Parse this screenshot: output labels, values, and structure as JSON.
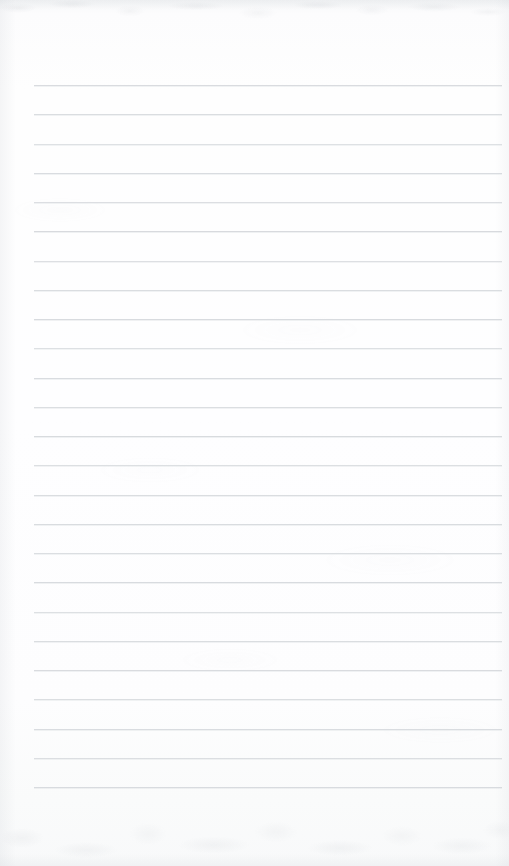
{
  "page": {
    "kind": "blank-ruled-notepad-page",
    "width": 509,
    "height": 866,
    "background_color": "#fdfdfe",
    "has_text": false,
    "text_content": "",
    "header_text": "",
    "footer_text": "",
    "margin_rule_visible": false,
    "page_number": ""
  },
  "ruling": {
    "line_color": "#d6d9dd",
    "line_thickness_px": 1,
    "line_count": 25,
    "left_x": 34,
    "right_x": 502,
    "first_line_y": 85,
    "last_line_y": 787,
    "spacing_px": 29.25,
    "lines_y": [
      85,
      114.3,
      143.5,
      172.8,
      202,
      231.3,
      260.5,
      289.8,
      319,
      348.3,
      377.5,
      406.8,
      436,
      465.3,
      494.5,
      523.8,
      553,
      582.3,
      611.5,
      640.8,
      670,
      699.3,
      728.5,
      757.8,
      787
    ],
    "line_opacity": [
      0.92,
      0.88,
      0.78,
      0.9,
      0.84,
      0.95,
      0.82,
      0.88,
      0.93,
      0.8,
      0.9,
      0.86,
      0.94,
      0.83,
      0.89,
      0.91,
      0.85,
      0.93,
      0.8,
      0.88,
      0.92,
      0.86,
      0.9,
      0.84,
      0.93
    ]
  },
  "texture": {
    "top_grain_color": "#a4a9b0",
    "bottom_grain_color": "#a6abb2",
    "edge_shade_color": "#cdd1d6"
  }
}
